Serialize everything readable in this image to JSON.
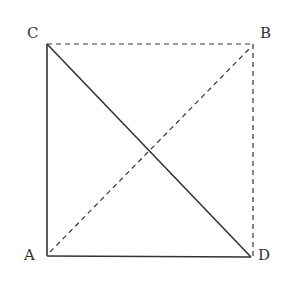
{
  "diagram": {
    "type": "geometry-square",
    "points": {
      "A": {
        "label": "A",
        "x": 47,
        "y": 256
      },
      "B": {
        "label": "B",
        "x": 253,
        "y": 44
      },
      "C": {
        "label": "C",
        "x": 47,
        "y": 44
      },
      "D": {
        "label": "D",
        "x": 251,
        "y": 257
      }
    },
    "segments": [
      {
        "from": "C",
        "to": "A",
        "style": "solid"
      },
      {
        "from": "A",
        "to": "D",
        "style": "solid"
      },
      {
        "from": "C",
        "to": "D",
        "style": "solid"
      },
      {
        "from": "C",
        "to": "B",
        "style": "dashed"
      },
      {
        "from": "B",
        "to": "D",
        "style": "dashed"
      },
      {
        "from": "A",
        "to": "B",
        "style": "dashed"
      }
    ],
    "stroke_color": "#333333"
  }
}
